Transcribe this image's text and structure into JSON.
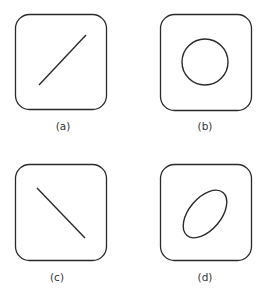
{
  "panels": [
    {
      "id": "a",
      "label": "(a)",
      "content": "diagonal-line-positive-slope"
    },
    {
      "id": "b",
      "label": "(b)",
      "content": "circle"
    },
    {
      "id": "c",
      "label": "(c)",
      "content": "diagonal-line-negative-slope"
    },
    {
      "id": "d",
      "label": "(d)",
      "content": "tilted-ellipse"
    }
  ],
  "colors": {
    "stroke": "#2a2a2a",
    "background": "#ffffff",
    "label": "#333333"
  }
}
